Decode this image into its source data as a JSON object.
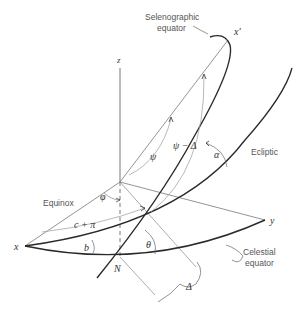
{
  "diagram": {
    "type": "celestial-coordinate-geometry",
    "labels": {
      "selenographic_equator_line1": "Selenographic",
      "selenographic_equator_line2": "equator",
      "x_prime": "x'",
      "z": "z",
      "psi": "ψ",
      "psi_minus_delta": "ψ − Δ",
      "alpha": "α",
      "ecliptic": "Ecliptic",
      "equinox": "Equinox",
      "phi": "φ",
      "c_plus_pi": "c + π",
      "x": "x",
      "y": "y",
      "b": "b",
      "theta": "θ",
      "N": "N",
      "celestial_equator_line1": "Celestial",
      "celestial_equator_line2": "equator",
      "delta": "Δ"
    },
    "colors": {
      "heavy_curve": "#2a2a2a",
      "thin_line": "#6a6a6a",
      "arc_arrow": "#8a8a8a",
      "text": "#555555"
    }
  }
}
